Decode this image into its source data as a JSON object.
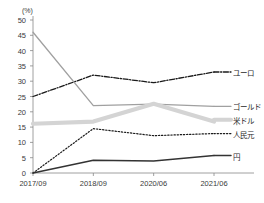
{
  "chart_data": {
    "type": "line",
    "title": "",
    "xlabel": "",
    "ylabel": "",
    "unit_label": "(%)",
    "categories": [
      "2017/09",
      "2018/09",
      "2020/06",
      "2021/06"
    ],
    "ylim": [
      0,
      50
    ],
    "ytick_values": [
      0,
      5,
      10,
      15,
      20,
      25,
      30,
      35,
      40,
      45,
      50
    ],
    "ytick_labels": [
      "0",
      "5",
      "10",
      "15",
      "20",
      "25",
      "30",
      "35",
      "40",
      "45",
      "50"
    ],
    "grid": false,
    "legend_position": "right-inline",
    "series": [
      {
        "name": "ユーロ",
        "label": "ユーロ",
        "values": [
          25.0,
          32.0,
          29.5,
          33.0
        ],
        "color": "#1a1a1a",
        "style": "dash-dot",
        "width": 1.3,
        "label_y": 33.0
      },
      {
        "name": "ゴールド",
        "label": "ゴールド",
        "values": [
          46.0,
          22.0,
          22.5,
          21.8
        ],
        "color": "#a0a0a0",
        "style": "solid",
        "width": 1.3,
        "label_y": 21.8
      },
      {
        "name": "米ドル",
        "label": "米ドル",
        "values": [
          16.1,
          16.8,
          22.6,
          16.8
        ],
        "color": "#d4d4d4",
        "style": "solid",
        "width": 4.2,
        "label_y": 17.4
      },
      {
        "name": "人民元",
        "label": "人民元",
        "values": [
          0.0,
          14.5,
          12.2,
          12.9
        ],
        "color": "#1a1a1a",
        "style": "dotted",
        "width": 1.2,
        "label_y": 12.9
      },
      {
        "name": "円",
        "label": "円",
        "values": [
          0.0,
          4.2,
          3.9,
          5.7
        ],
        "color": "#333333",
        "style": "solid",
        "width": 1.5,
        "label_y": 5.7
      }
    ]
  }
}
